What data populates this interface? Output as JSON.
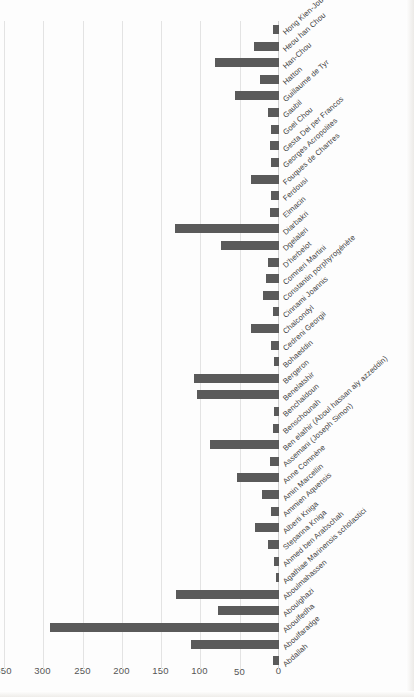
{
  "chart_data": {
    "type": "bar",
    "orientation": "horizontal",
    "title": "",
    "subtitle": "",
    "xlabel": "",
    "ylabel": "",
    "grid": true,
    "legend": false,
    "legend_position": "none",
    "value_axis_ticks": [
      "0",
      "50",
      "100",
      "150",
      "200",
      "250",
      "300",
      "350"
    ],
    "ylim": [
      0,
      350
    ],
    "bar_color": "#5a5a5a",
    "gridline_color": "#e3e3e3",
    "categories": [
      "Abdallah",
      "Aboulfaradge",
      "Aboulfedha",
      "Aboulghazi",
      "Aboulmahassen",
      "Agathiae Marinensis scholastici",
      "Ahmed ben Arabschah",
      "Stepanna Kniga",
      "Alberti Kniga",
      "Ammien Aquensis",
      "Amin Marcellin",
      "Anne Comnène",
      "Assemani (Joseph Simon)",
      "Ben elathir (Aboul hassan aly azzeddin)",
      "Benschounah",
      "Benchaldoun",
      "Benelatshir",
      "Bergeron",
      "Bohaeddin",
      "Cedreni Georgii",
      "Chalcondyl",
      "Cinnami Joannis",
      "Constantin porphyrogénète",
      "Comneri Martini",
      "D'herbelot",
      "Dgelaleri",
      "Diarbakri",
      "Elmacin",
      "Ferdousi",
      "Fouques de Chartres",
      "Georges Acropolites",
      "Gesta Dei per Francos",
      "Goel Chou",
      "Gaubil",
      "Guillaume de Tyr",
      "Hatton",
      "Han-Chou",
      "Heou han Chou",
      "Hong Kien-Jou"
    ],
    "values": [
      8,
      112,
      292,
      78,
      131,
      4,
      6,
      14,
      30,
      10,
      22,
      54,
      12,
      88,
      8,
      6,
      104,
      108,
      6,
      10,
      36,
      8,
      20,
      16,
      14,
      74,
      132,
      12,
      10,
      36,
      10,
      12,
      10,
      14,
      56,
      24,
      82,
      32,
      8
    ]
  }
}
